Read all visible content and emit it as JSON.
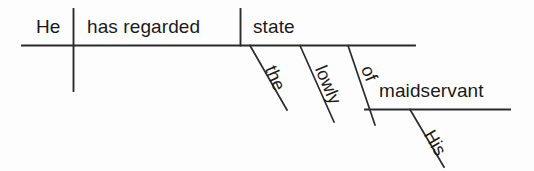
{
  "diagram": {
    "type": "reed-kellogg-sentence-diagram",
    "sentence": "He has regarded the lowly state of His maidservant",
    "line_color": "#2b2b2b",
    "text_color": "#1a1a1a",
    "background_color": "#fdfdfd",
    "nodes": {
      "subject": "He",
      "verb": "has regarded",
      "direct_object": "state",
      "article": "the",
      "adjective": "lowly",
      "preposition": "of",
      "object_of_preposition": "maidservant",
      "possessive": "His"
    }
  }
}
